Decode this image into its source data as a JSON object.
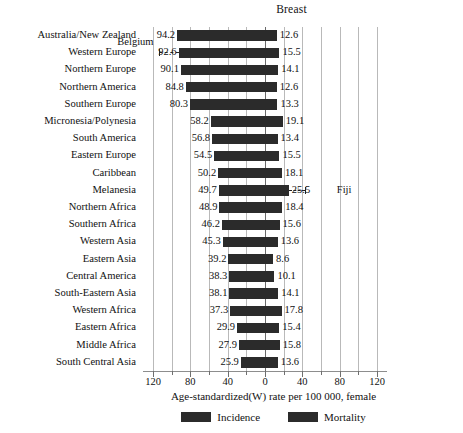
{
  "chart_data": {
    "type": "bar",
    "orientation": "horizontal-diverging",
    "title": "Breast",
    "xlabel": "Age-standardized(W) rate per 100 000, female",
    "ylabel": "",
    "xlim": [
      -130,
      130
    ],
    "xticks": [
      120,
      80,
      40,
      0,
      40,
      80,
      120
    ],
    "xtick_labels": [
      "120",
      "80",
      "40",
      "0",
      "40",
      "80",
      "120"
    ],
    "gridlines": [
      120,
      100,
      80,
      60,
      40,
      20,
      0,
      20,
      40,
      60,
      80,
      100,
      120
    ],
    "grid": true,
    "legend_position": "bottom",
    "categories": [
      "Australia/New Zealand",
      "Western Europe",
      "Northern Europe",
      "Northern America",
      "Southern Europe",
      "Micronesia/Polynesia",
      "South America",
      "Eastern Europe",
      "Caribbean",
      "Melanesia",
      "Northern Africa",
      "Southern Africa",
      "Western Asia",
      "Eastern Asia",
      "Central America",
      "South-Eastern Asia",
      "Western Africa",
      "Eastern Africa",
      "Middle Africa",
      "South Central Asia"
    ],
    "series": [
      {
        "name": "Incidence",
        "side": "left",
        "color": "#2b2b2b",
        "values": [
          94.2,
          92.6,
          90.1,
          84.8,
          80.3,
          58.2,
          56.8,
          54.5,
          50.2,
          49.7,
          48.9,
          46.2,
          45.3,
          39.2,
          38.3,
          38.1,
          37.3,
          29.9,
          27.9,
          25.9
        ]
      },
      {
        "name": "Mortality",
        "side": "right",
        "color": "#2b2b2b",
        "values": [
          12.6,
          15.5,
          14.1,
          12.6,
          13.3,
          19.1,
          13.4,
          15.5,
          18.1,
          25.5,
          18.4,
          15.6,
          13.6,
          8.6,
          10.1,
          14.1,
          17.8,
          15.4,
          15.8,
          13.6
        ]
      }
    ],
    "annotations": [
      {
        "label": "Belgium",
        "row": "Western Europe",
        "row_index": 1,
        "side": "left",
        "value": 113.2
      },
      {
        "label": "Fiji",
        "row": "Melanesia",
        "row_index": 9,
        "side": "right",
        "value": 25.5
      }
    ]
  },
  "legend": {
    "items": [
      {
        "label": "Incidence",
        "color": "#2b2b2b"
      },
      {
        "label": "Mortality",
        "color": "#2b2b2b"
      }
    ]
  }
}
